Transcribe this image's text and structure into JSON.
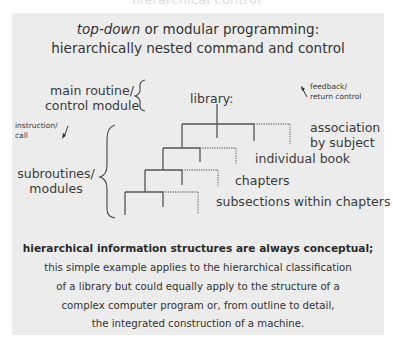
{
  "top_title": "hierarchical control",
  "heading": {
    "line1_italic": "top-down",
    "line1_rest": " or modular programming:",
    "line2": "hierarchically nested command and control"
  },
  "labels": {
    "main_routine_line1": "main routine/",
    "main_routine_line2": "control module",
    "instruction_line1": "instruction/",
    "instruction_line2": "call",
    "subroutines_line1": "subroutines/",
    "subroutines_line2": "modules",
    "library": "library:",
    "feedback_line1": "feedback/",
    "feedback_line2": "return control",
    "association_line1": "association",
    "association_line2": "by subject",
    "individual_book": "individual book",
    "chapters": "chapters",
    "subsections": "subsections within chapters"
  },
  "footer": {
    "bold_line": "hierarchical information structures are always conceptual;",
    "lines": [
      "this simple example applies to the hierarchical classification",
      "of a library but could equally apply to the structure of a",
      "complex computer program or, from outline to detail,",
      "the integrated construction of a machine."
    ]
  },
  "colors": {
    "panel": "#ececec",
    "line": "#555555",
    "text": "#333333"
  }
}
